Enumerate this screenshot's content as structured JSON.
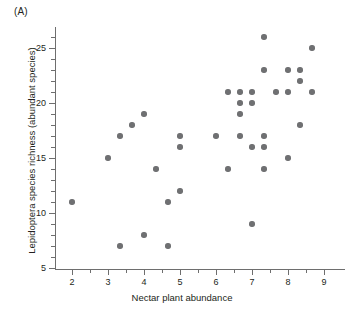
{
  "panel": {
    "label": "(A)"
  },
  "chart_data": {
    "type": "scatter",
    "title": "",
    "panel_label": "(A)",
    "xlabel": "Nectar plant abundance",
    "ylabel": "Lepidoptera species richness (abundant species)",
    "xlim": [
      1.55,
      9.6
    ],
    "ylim": [
      4.3,
      26.9
    ],
    "xticks": [
      2,
      3,
      4,
      5,
      6,
      7,
      8,
      9
    ],
    "yticks": [
      5,
      10,
      15,
      20,
      25
    ],
    "xtick_labels": [
      "2",
      "3",
      "4",
      "5",
      "6",
      "7",
      "8",
      "9"
    ],
    "ytick_labels": [
      "5",
      "10",
      "15",
      "20",
      "25"
    ],
    "x_minor_tick_step": 0.5,
    "y_minor_tick_step": 1,
    "grid": false,
    "legend": null,
    "marker": {
      "shape": "circle",
      "color": "#6f7072",
      "size_px": 5.4
    },
    "point_count": 38,
    "points": [
      {
        "x": 2.0,
        "y": 11
      },
      {
        "x": 3.0,
        "y": 15
      },
      {
        "x": 3.33,
        "y": 17
      },
      {
        "x": 3.33,
        "y": 7
      },
      {
        "x": 3.67,
        "y": 18
      },
      {
        "x": 4.0,
        "y": 19
      },
      {
        "x": 4.0,
        "y": 8
      },
      {
        "x": 4.33,
        "y": 14
      },
      {
        "x": 4.67,
        "y": 11
      },
      {
        "x": 4.67,
        "y": 7
      },
      {
        "x": 5.0,
        "y": 17
      },
      {
        "x": 5.0,
        "y": 16
      },
      {
        "x": 5.0,
        "y": 12
      },
      {
        "x": 6.0,
        "y": 17
      },
      {
        "x": 6.33,
        "y": 21
      },
      {
        "x": 6.33,
        "y": 14
      },
      {
        "x": 6.67,
        "y": 21
      },
      {
        "x": 6.67,
        "y": 20
      },
      {
        "x": 6.67,
        "y": 19
      },
      {
        "x": 6.67,
        "y": 17
      },
      {
        "x": 7.0,
        "y": 21
      },
      {
        "x": 7.0,
        "y": 20
      },
      {
        "x": 7.0,
        "y": 16
      },
      {
        "x": 7.0,
        "y": 9
      },
      {
        "x": 7.33,
        "y": 26
      },
      {
        "x": 7.33,
        "y": 23
      },
      {
        "x": 7.33,
        "y": 17
      },
      {
        "x": 7.33,
        "y": 16
      },
      {
        "x": 7.33,
        "y": 14
      },
      {
        "x": 7.67,
        "y": 21
      },
      {
        "x": 8.0,
        "y": 23
      },
      {
        "x": 8.0,
        "y": 21
      },
      {
        "x": 8.0,
        "y": 15
      },
      {
        "x": 8.33,
        "y": 23
      },
      {
        "x": 8.33,
        "y": 22
      },
      {
        "x": 8.33,
        "y": 18
      },
      {
        "x": 8.67,
        "y": 25
      },
      {
        "x": 8.67,
        "y": 21
      }
    ]
  },
  "colors": {
    "marker": "#6f7072",
    "axis": "#6e6e6e",
    "text": "#231f20",
    "background": "#ffffff"
  }
}
